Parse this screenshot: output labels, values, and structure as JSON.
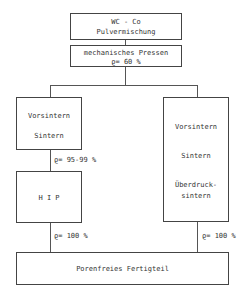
{
  "boxes": {
    "start": {
      "line1": "WC - Co",
      "line2": "Pulvermischung"
    },
    "press": {
      "line1": "mechanisches Pressen",
      "line2": "ϱ= 60 %"
    },
    "left_sinter": {
      "line1": "Vorsintern",
      "line2": "Sintern"
    },
    "hip": {
      "line1": "H I P"
    },
    "right_sinter": {
      "line1": "Vorsintern",
      "line2": "Sintern",
      "line3": "Überdruck-",
      "line4": "sintern"
    },
    "final": {
      "line1": "Porenfreies Fertigteil"
    }
  },
  "labels": {
    "left_density_1": "ϱ= 95-99 %",
    "left_density_2": "ϱ= 100 %",
    "right_density": "ϱ= 100 %"
  }
}
